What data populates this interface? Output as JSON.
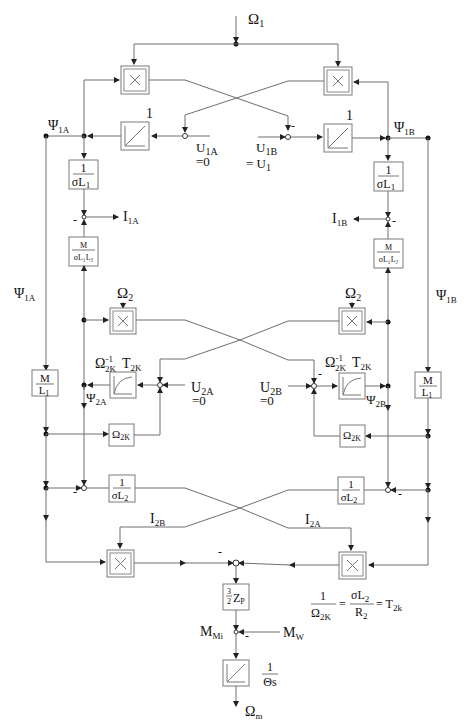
{
  "diagram": {
    "inputs": {
      "omega1": {
        "sym": "Ω",
        "sub": "1"
      },
      "u1a": {
        "sym": "U",
        "sub": "1A",
        "value": "=0"
      },
      "u1b": {
        "sym": "U",
        "sub": "1B",
        "value": "= U",
        "value_sub": "1"
      },
      "u2a": {
        "sym": "U",
        "sub": "2A",
        "value": "=0"
      },
      "u2b": {
        "sym": "U",
        "sub": "2B",
        "value": "=0"
      },
      "omega2_left": {
        "sym": "Ω",
        "sub": "2"
      },
      "omega2_right": {
        "sym": "Ω",
        "sub": "2"
      },
      "mw": {
        "sym": "M",
        "sub": "W"
      }
    },
    "signals": {
      "psi1a_top": {
        "sym": "Ψ",
        "sub": "1A"
      },
      "psi1b_top": {
        "sym": "Ψ",
        "sub": "1B"
      },
      "psi1a_side": {
        "sym": "Ψ",
        "sub": "1A"
      },
      "psi1b_side": {
        "sym": "Ψ",
        "sub": "1B"
      },
      "i1a": {
        "sym": "I",
        "sub": "1A"
      },
      "i1b": {
        "sym": "I",
        "sub": "1B"
      },
      "psi2a": {
        "sym": "Ψ",
        "sub": "2A"
      },
      "psi2b": {
        "sym": "Ψ",
        "sub": "2B"
      },
      "i2a": {
        "sym": "I",
        "sub": "2A"
      },
      "i2b": {
        "sym": "I",
        "sub": "2B"
      },
      "mmi": {
        "sym": "M",
        "sub": "Mi"
      },
      "omega_m": {
        "sym": "Ω",
        "sub": "m"
      }
    },
    "blocks": {
      "mult_top_left": "×",
      "mult_top_right": "×",
      "mult_mid_left": "×",
      "mult_mid_right": "×",
      "mult_bot_left": "×",
      "mult_bot_right": "×",
      "integrator_gain_left": "1",
      "integrator_gain_right": "1",
      "inv_sigma_l1": {
        "num": "1",
        "den": "σL",
        "den_sub": "1"
      },
      "m_sigma_l1l2": {
        "num": "M",
        "den": "σL₁L₂"
      },
      "m_over_l1": {
        "num": "M",
        "den": "L",
        "den_sub": "1"
      },
      "omega2k_block": {
        "sym": "Ω",
        "sub": "2K"
      },
      "pt1_label": {
        "sym": "Ω",
        "sup": "-1",
        "sub": "2K",
        "t": "T",
        "t_sub": "2K"
      },
      "inv_sigma_l2": {
        "num": "1",
        "den": "σL",
        "den_sub": "2"
      },
      "torque_gain": {
        "frac_num": "3",
        "frac_den": "2",
        "var": "Z",
        "var_sub": "P"
      },
      "mech_integrator": {
        "num": "1",
        "den": "Θs"
      }
    },
    "signs": {
      "minus": "-"
    },
    "equation": {
      "lhs_num": "1",
      "lhs_den": "Ω",
      "lhs_den_sub": "2K",
      "eq1": "=",
      "mid_num": "σL",
      "mid_num_sub": "2",
      "mid_den": "R",
      "mid_den_sub": "2",
      "eq2": "= T",
      "rhs_sub": "2k"
    }
  }
}
